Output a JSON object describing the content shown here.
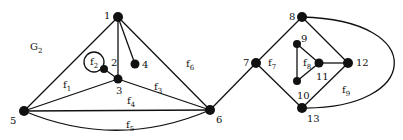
{
  "graph_label": {
    "main": "G",
    "sub": "2",
    "x": 30,
    "y": 50
  },
  "nodes": [
    {
      "id": "1",
      "x": 118,
      "y": 17,
      "r": 5,
      "lx": 104,
      "ly": 19
    },
    {
      "id": "2",
      "x": 104,
      "y": 69,
      "r": 4,
      "lx": 111,
      "ly": 66
    },
    {
      "id": "3",
      "x": 118,
      "y": 79,
      "r": 4.5,
      "lx": 116,
      "ly": 94
    },
    {
      "id": "4",
      "x": 135,
      "y": 64,
      "r": 4.5,
      "lx": 142,
      "ly": 68
    },
    {
      "id": "5",
      "x": 24,
      "y": 111,
      "r": 5,
      "lx": 10,
      "ly": 124
    },
    {
      "id": "6",
      "x": 210,
      "y": 110,
      "r": 5,
      "lx": 216,
      "ly": 123
    },
    {
      "id": "7",
      "x": 256,
      "y": 63,
      "r": 5,
      "lx": 243,
      "ly": 66
    },
    {
      "id": "8",
      "x": 302,
      "y": 17,
      "r": 5,
      "lx": 289,
      "ly": 20
    },
    {
      "id": "9",
      "x": 297,
      "y": 44,
      "r": 4,
      "lx": 301,
      "ly": 42
    },
    {
      "id": "10",
      "x": 297,
      "y": 81,
      "r": 4,
      "lx": 297,
      "ly": 99
    },
    {
      "id": "11",
      "x": 319,
      "y": 63,
      "r": 4.5,
      "lx": 316,
      "ly": 80
    },
    {
      "id": "12",
      "x": 348,
      "y": 63,
      "r": 5,
      "lx": 356,
      "ly": 66
    },
    {
      "id": "13",
      "x": 302,
      "y": 108,
      "r": 5,
      "lx": 307,
      "ly": 122
    }
  ],
  "edges": [
    [
      "1",
      "5"
    ],
    [
      "1",
      "3"
    ],
    [
      "1",
      "4"
    ],
    [
      "1",
      "6"
    ],
    [
      "2",
      "3"
    ],
    [
      "3",
      "5"
    ],
    [
      "3",
      "6"
    ],
    [
      "5",
      "6"
    ],
    [
      "6",
      "7"
    ],
    [
      "7",
      "8"
    ],
    [
      "7",
      "13"
    ],
    [
      "8",
      "12"
    ],
    [
      "12",
      "13"
    ],
    [
      "9",
      "10"
    ],
    [
      "9",
      "11"
    ],
    [
      "10",
      "11"
    ],
    [
      "11",
      "12"
    ]
  ],
  "curved_edges": [
    {
      "from": "5",
      "to": "6",
      "path": "M24,111 Q117,150 210,110"
    },
    {
      "from": "8",
      "to": "13",
      "path": "M302,17 C430,20 420,110 302,108"
    }
  ],
  "loops": [
    {
      "node": "2",
      "cx": 94,
      "cy": 62,
      "r": 10
    }
  ],
  "faces": [
    {
      "main": "f",
      "sub": "1",
      "x": 63,
      "y": 88
    },
    {
      "main": "f",
      "sub": "2",
      "x": 90,
      "y": 65
    },
    {
      "main": "f",
      "sub": "3",
      "x": 154,
      "y": 90
    },
    {
      "main": "f",
      "sub": "4",
      "x": 127,
      "y": 104
    },
    {
      "main": "f",
      "sub": "5",
      "x": 126,
      "y": 128
    },
    {
      "main": "f",
      "sub": "6",
      "x": 186,
      "y": 67
    },
    {
      "main": "f",
      "sub": "7",
      "x": 268,
      "y": 66
    },
    {
      "main": "f",
      "sub": "8",
      "x": 303,
      "y": 66
    },
    {
      "main": "f",
      "sub": "9",
      "x": 342,
      "y": 93
    }
  ]
}
